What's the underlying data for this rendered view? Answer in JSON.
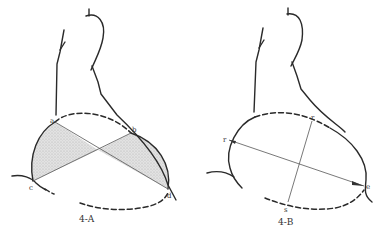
{
  "figures": [
    {
      "id": "4-A",
      "caption": "4-A",
      "points": {
        "a": "a",
        "b": "b",
        "c": "c",
        "d": "d"
      },
      "shaded_color": "#d8d8d8"
    },
    {
      "id": "4-B",
      "caption": "4-B",
      "points": {
        "r1": "r",
        "r2": "r",
        "s": "s",
        "s_top": "s",
        "e": "e"
      }
    }
  ],
  "colors": {
    "ink": "#2a2a2a",
    "background": "#ffffff"
  }
}
